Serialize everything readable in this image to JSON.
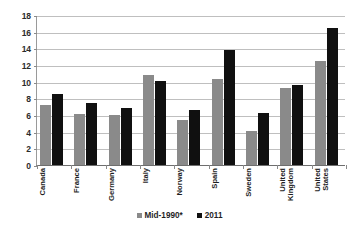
{
  "chart_data": {
    "type": "bar",
    "title": "",
    "subtitle": "",
    "xlabel": "",
    "ylabel": "",
    "ylim": [
      0,
      18
    ],
    "ytick_step": 2,
    "ytick_labels": [
      "18",
      "16",
      "14",
      "12",
      "10",
      "8",
      "6",
      "4",
      "2",
      "0"
    ],
    "grid": true,
    "legend_position": "bottom",
    "categories": [
      "Canada",
      "France",
      "Germany",
      "Italy",
      "Norway",
      "Spain",
      "Sweden",
      "United Kingdom",
      "United States"
    ],
    "category_lines": [
      [
        "Canada"
      ],
      [
        "France"
      ],
      [
        "Germany"
      ],
      [
        "Italy"
      ],
      [
        "Norway"
      ],
      [
        "Spain"
      ],
      [
        "Sweden"
      ],
      [
        "United",
        "Kingdom"
      ],
      [
        "United",
        "States"
      ]
    ],
    "series": [
      {
        "name": "Mid-1990*",
        "color": "#8a8a8a",
        "values": [
          7.2,
          6.1,
          6.0,
          10.8,
          5.4,
          10.3,
          4.1,
          9.2,
          12.5
        ]
      },
      {
        "name": "2011",
        "color": "#101010",
        "values": [
          8.5,
          7.45,
          6.9,
          10.1,
          6.6,
          13.8,
          6.3,
          9.6,
          16.5
        ]
      }
    ]
  },
  "legend": {
    "items": [
      {
        "label": "Mid-1990*",
        "color": "#8a8a8a"
      },
      {
        "label": "2011",
        "color": "#101010"
      }
    ]
  },
  "colors": {
    "series_1": "#8a8a8a",
    "series_2": "#101010",
    "gridline": "#bfbfbf",
    "axis": "#6e6e6e",
    "text": "#1f1f1f",
    "background": "#ffffff"
  }
}
